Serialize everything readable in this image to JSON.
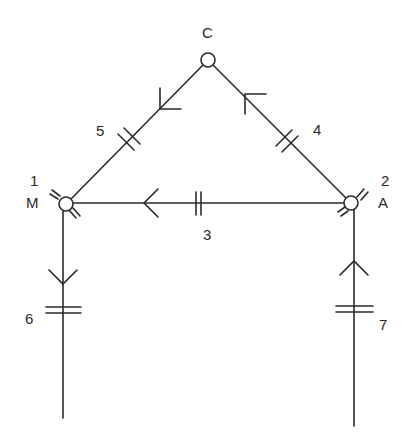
{
  "diagram": {
    "type": "node-link graph",
    "nodes": [
      {
        "id": "C",
        "number": "",
        "letter": "C",
        "cx": 208,
        "cy": 60,
        "r": 7
      },
      {
        "id": "M",
        "number": "1",
        "letter": "M",
        "cx": 66,
        "cy": 204,
        "r": 7
      },
      {
        "id": "A",
        "number": "2",
        "letter": "A",
        "cx": 351,
        "cy": 203,
        "r": 7
      }
    ],
    "edges": [
      {
        "label": "3",
        "from": "A",
        "to": "M",
        "direction": "A to M"
      },
      {
        "label": "4",
        "from": "A",
        "to": "C",
        "direction": "A to C"
      },
      {
        "label": "5",
        "from": "C",
        "to": "M",
        "direction": "C to M"
      },
      {
        "label": "6",
        "from": "M",
        "to": "bottom-left",
        "direction": "downward"
      },
      {
        "label": "7",
        "from": "bottom-right",
        "to": "A",
        "direction": "upward"
      }
    ],
    "labels": {
      "node_c": "C",
      "node_m_number": "1",
      "node_m_letter": "M",
      "node_a_number": "2",
      "node_a_letter": "A",
      "edge_3": "3",
      "edge_4": "4",
      "edge_5": "5",
      "edge_6": "6",
      "edge_7": "7"
    },
    "colors": {
      "stroke": "#2a2a2a",
      "background": "#ffffff"
    }
  }
}
